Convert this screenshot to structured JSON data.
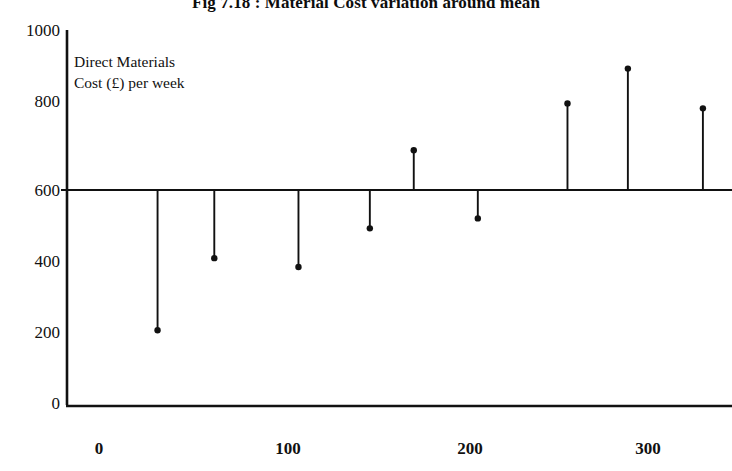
{
  "chart_data": {
    "type": "scatter",
    "title": "Fig 7.18 : Material Cost variation around mean",
    "xlabel": "",
    "ylabel": "",
    "annotation_lines": [
      "Direct Materials",
      "Cost (£) per week"
    ],
    "xlim": [
      -15,
      355
    ],
    "ylim": [
      0,
      1000
    ],
    "xticks": [
      0,
      100,
      200,
      300
    ],
    "xtick_labels": [
      "0",
      "100",
      "200",
      "300"
    ],
    "yticks": [
      0,
      200,
      400,
      600,
      800,
      1000
    ],
    "ytick_labels": [
      "0",
      "200",
      "400",
      "600",
      "800",
      "1000"
    ],
    "grid": false,
    "legend": "none",
    "mean_line_value": 600,
    "x": [
      32,
      63,
      109,
      148,
      172,
      207,
      256,
      289,
      330
    ],
    "values": [
      205,
      408,
      383,
      492,
      712,
      520,
      844,
      942,
      830
    ],
    "series": [
      {
        "name": "Direct Materials Cost (£) per week",
        "x": [
          32,
          63,
          109,
          148,
          172,
          207,
          256,
          289,
          330
        ],
        "values": [
          205,
          408,
          383,
          492,
          712,
          520,
          844,
          942,
          830
        ]
      }
    ]
  },
  "axis": {
    "y_labels": [
      "1000",
      "800",
      "600",
      "400",
      "200",
      "0"
    ],
    "x_labels": [
      "0",
      "100",
      "200",
      "300"
    ]
  },
  "annotation": {
    "line1": "Direct Materials",
    "line2": "Cost (£) per week"
  },
  "title": {
    "text": "Fig 7.18 : Material Cost variation around mean"
  },
  "colors": {
    "ink": "#111111",
    "background": "#ffffff"
  }
}
